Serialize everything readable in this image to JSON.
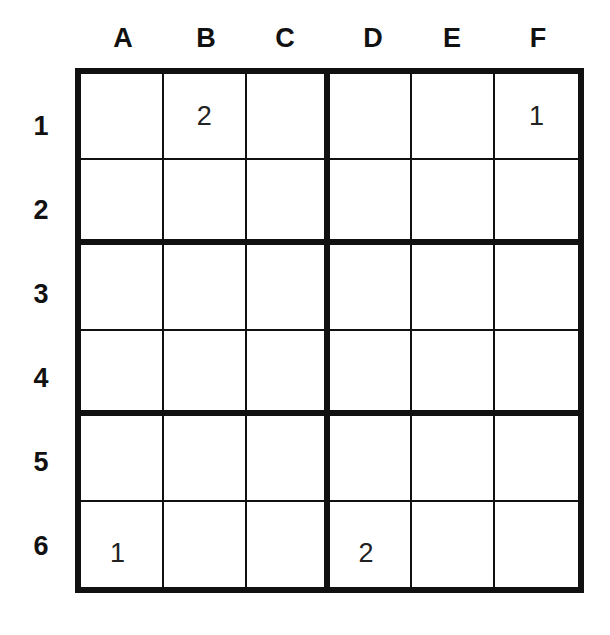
{
  "puzzle": {
    "columns": [
      "A",
      "B",
      "C",
      "D",
      "E",
      "F"
    ],
    "rows": [
      "1",
      "2",
      "3",
      "4",
      "5",
      "6"
    ],
    "cells": [
      [
        "",
        "2",
        "",
        "",
        "",
        "1"
      ],
      [
        "",
        "",
        "",
        "",
        "",
        ""
      ],
      [
        "",
        "",
        "",
        "",
        "",
        ""
      ],
      [
        "",
        "",
        "",
        "",
        "",
        ""
      ],
      [
        "",
        "",
        "",
        "",
        "",
        ""
      ],
      [
        "1",
        "",
        "",
        "2",
        "",
        ""
      ]
    ],
    "box_size": {
      "rows": 2,
      "cols": 3
    }
  }
}
